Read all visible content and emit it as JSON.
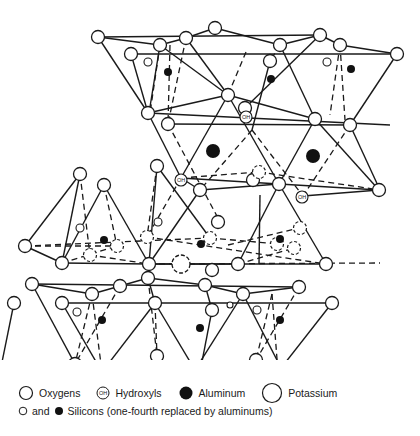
{
  "figure": {
    "legend": {
      "oxygens": "Oxygens",
      "hydroxyls": "Hydroxyls",
      "hydroxyl_symbol": "OH",
      "aluminum": "Aluminum",
      "potassium": "Potassium",
      "and": "and",
      "silicons": "Silicons (one-fourth replaced by aluminums)"
    },
    "colors": {
      "line": "#1a1a1a",
      "fill_open": "#ffffff",
      "fill_solid": "#111111"
    }
  }
}
